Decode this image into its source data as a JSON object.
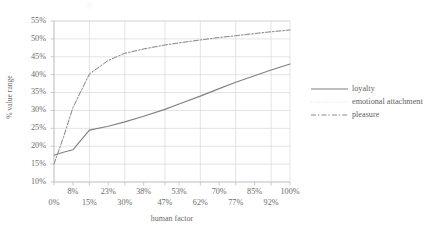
{
  "axes": {
    "y_title": "% value range",
    "x_title": "human factor",
    "y_ticks": [
      "55%",
      "50%",
      "45%",
      "40%",
      "35%",
      "30%",
      "25%",
      "20%",
      "15%",
      "10%"
    ],
    "x_ticks_top": [
      "8%",
      "23%",
      "38%",
      "53%",
      "70%",
      "85%",
      "100%"
    ],
    "x_ticks_bottom": [
      "0%",
      "15%",
      "30%",
      "47%",
      "62%",
      "77%",
      "92%"
    ]
  },
  "legend": {
    "items": [
      {
        "label": "loyalty",
        "style": "solid",
        "color": "#808080",
        "icon": "line-solid-icon"
      },
      {
        "label": "emotional attachment",
        "style": "dotted",
        "color": "#e3e3e3",
        "icon": "line-dotted-icon"
      },
      {
        "label": "pleasure",
        "style": "dash-dot",
        "color": "#8a8a8a",
        "icon": "line-dash-dot-icon"
      }
    ]
  },
  "chart_data": {
    "type": "line",
    "title": "",
    "xlabel": "human factor",
    "ylabel": "% value range",
    "xlim": [
      0,
      100
    ],
    "ylim": [
      10,
      55
    ],
    "grid": true,
    "legend_position": "right",
    "y_tick_values": [
      10,
      15,
      20,
      25,
      30,
      35,
      40,
      45,
      50,
      55
    ],
    "x_tick_values": [
      0,
      8,
      15,
      23,
      30,
      38,
      47,
      53,
      62,
      70,
      77,
      85,
      92,
      100
    ],
    "x": [
      0,
      4,
      8,
      15,
      23,
      30,
      38,
      47,
      53,
      62,
      70,
      77,
      85,
      92,
      100
    ],
    "series": [
      {
        "name": "loyalty",
        "style": "solid",
        "color": "#808080",
        "values": [
          17.5,
          18.3,
          19.0,
          24.5,
          25.6,
          26.8,
          28.4,
          30.3,
          31.8,
          34.0,
          36.1,
          37.9,
          39.7,
          41.3,
          43.0
        ]
      },
      {
        "name": "emotional attachment",
        "style": "dotted",
        "color": "#e3e3e3",
        "values": [
          15.2,
          22.5,
          30.5,
          40.0,
          43.8,
          45.8,
          47.1,
          48.2,
          48.8,
          49.6,
          50.3,
          50.8,
          51.4,
          51.9,
          52.4
        ]
      },
      {
        "name": "pleasure",
        "style": "dash-dot",
        "color": "#8a8a8a",
        "values": [
          15.0,
          22.5,
          30.8,
          40.2,
          44.0,
          46.0,
          47.2,
          48.3,
          48.9,
          49.7,
          50.4,
          50.9,
          51.5,
          52.0,
          52.5
        ]
      }
    ]
  },
  "colors": {
    "grid": "#d9d9d9",
    "axis": "#bfbfbf",
    "text": "#6b6b6b",
    "background": "#ffffff"
  }
}
